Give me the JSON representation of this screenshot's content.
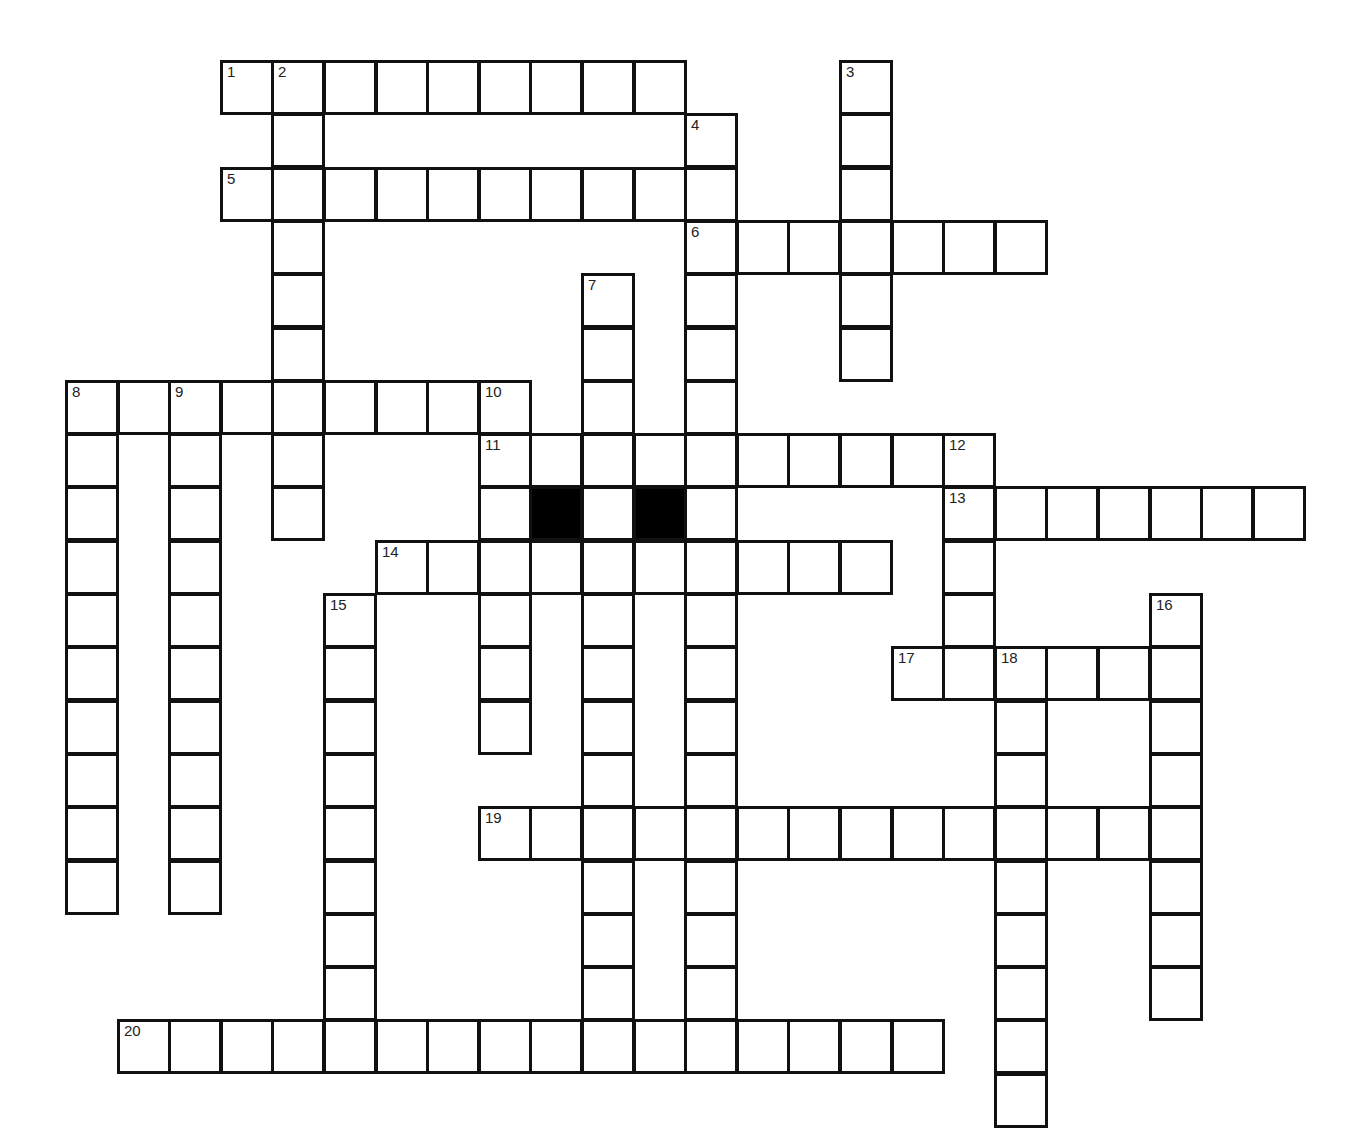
{
  "puzzle": {
    "origin_x": 65,
    "origin_y": 60,
    "cell_w": 51.6,
    "cell_h": 53.3,
    "colors": {
      "border": "#111111",
      "fill": "#ffffff",
      "block": "#000000",
      "number": "#222222"
    },
    "entries": [
      {
        "number": 1,
        "direction": "across",
        "row": 0,
        "col": 3,
        "length": 9
      },
      {
        "number": 2,
        "direction": "down",
        "row": 0,
        "col": 4,
        "length": 9
      },
      {
        "number": 3,
        "direction": "down",
        "row": 0,
        "col": 15,
        "length": 6
      },
      {
        "number": 4,
        "direction": "down",
        "row": 1,
        "col": 12,
        "length": 18
      },
      {
        "number": 5,
        "direction": "across",
        "row": 2,
        "col": 3,
        "length": 10
      },
      {
        "number": 6,
        "direction": "across",
        "row": 3,
        "col": 12,
        "length": 7
      },
      {
        "number": 7,
        "direction": "down",
        "row": 4,
        "col": 10,
        "length": 15
      },
      {
        "number": 8,
        "direction": "across",
        "row": 6,
        "col": 0,
        "length": 9
      },
      {
        "number": 8,
        "direction": "down",
        "row": 6,
        "col": 0,
        "length": 10
      },
      {
        "number": 9,
        "direction": "down",
        "row": 6,
        "col": 2,
        "length": 10
      },
      {
        "number": 10,
        "direction": "down",
        "row": 6,
        "col": 8,
        "length": 7
      },
      {
        "number": 11,
        "direction": "across",
        "row": 7,
        "col": 8,
        "length": 10
      },
      {
        "number": 12,
        "direction": "down",
        "row": 7,
        "col": 17,
        "length": 5
      },
      {
        "number": 13,
        "direction": "across",
        "row": 8,
        "col": 17,
        "length": 7
      },
      {
        "number": 14,
        "direction": "across",
        "row": 9,
        "col": 6,
        "length": 10
      },
      {
        "number": 15,
        "direction": "down",
        "row": 10,
        "col": 5,
        "length": 9
      },
      {
        "number": 16,
        "direction": "down",
        "row": 10,
        "col": 21,
        "length": 8
      },
      {
        "number": 17,
        "direction": "across",
        "row": 11,
        "col": 16,
        "length": 6
      },
      {
        "number": 18,
        "direction": "down",
        "row": 11,
        "col": 18,
        "length": 9
      },
      {
        "number": 19,
        "direction": "across",
        "row": 14,
        "col": 8,
        "length": 13
      },
      {
        "number": 20,
        "direction": "across",
        "row": 18,
        "col": 1,
        "length": 16
      }
    ],
    "black_cells": [
      {
        "row": 8,
        "col": 9
      },
      {
        "row": 8,
        "col": 11
      }
    ],
    "numbered_cells": [
      {
        "number": "1",
        "row": 0,
        "col": 3
      },
      {
        "number": "2",
        "row": 0,
        "col": 4
      },
      {
        "number": "3",
        "row": 0,
        "col": 15
      },
      {
        "number": "4",
        "row": 1,
        "col": 12
      },
      {
        "number": "5",
        "row": 2,
        "col": 3
      },
      {
        "number": "6",
        "row": 3,
        "col": 12
      },
      {
        "number": "7",
        "row": 4,
        "col": 10
      },
      {
        "number": "8",
        "row": 6,
        "col": 0
      },
      {
        "number": "9",
        "row": 6,
        "col": 2
      },
      {
        "number": "10",
        "row": 6,
        "col": 8
      },
      {
        "number": "11",
        "row": 7,
        "col": 8
      },
      {
        "number": "12",
        "row": 7,
        "col": 17
      },
      {
        "number": "13",
        "row": 8,
        "col": 17
      },
      {
        "number": "14",
        "row": 9,
        "col": 6
      },
      {
        "number": "15",
        "row": 10,
        "col": 5
      },
      {
        "number": "16",
        "row": 10,
        "col": 21
      },
      {
        "number": "17",
        "row": 11,
        "col": 16
      },
      {
        "number": "18",
        "row": 11,
        "col": 18
      },
      {
        "number": "19",
        "row": 14,
        "col": 8
      },
      {
        "number": "20",
        "row": 18,
        "col": 1
      }
    ]
  }
}
